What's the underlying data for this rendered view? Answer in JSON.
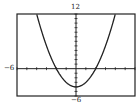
{
  "chart_data": {
    "type": "line",
    "title": "",
    "function": "y = x^2 - 4",
    "xlabel": "",
    "ylabel": "",
    "xlim": [
      -6,
      6
    ],
    "ylim": [
      -6,
      12
    ],
    "x_tick_step": 1,
    "y_tick_step": 1,
    "grid": false,
    "tick_labels": {
      "xmin": "−6",
      "ymax": "12",
      "ymin": "−6"
    },
    "series": [
      {
        "name": "f(x)",
        "x": [
          -4,
          -3,
          -2,
          -1,
          0,
          1,
          2,
          3,
          4
        ],
        "y": [
          12,
          5,
          0,
          -3,
          -4,
          -3,
          0,
          5,
          12
        ]
      }
    ],
    "colors": {
      "curve": "#222222",
      "axes": "#222222",
      "frame": "#222222"
    }
  }
}
